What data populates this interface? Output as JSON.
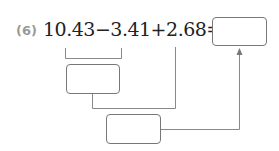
{
  "problem": {
    "number_label": "(6)",
    "expression": "10.43−3.41+2.68=",
    "terms": [
      "10.43",
      "3.41",
      "2.68"
    ],
    "operators": [
      "−",
      "+"
    ],
    "equals": "="
  },
  "boxes": {
    "final_answer": "",
    "step1_result": "",
    "step2_result": ""
  },
  "colors": {
    "label": "#9a9a9a",
    "text": "#222222",
    "lines": "#888888",
    "box_border": "#777777"
  }
}
